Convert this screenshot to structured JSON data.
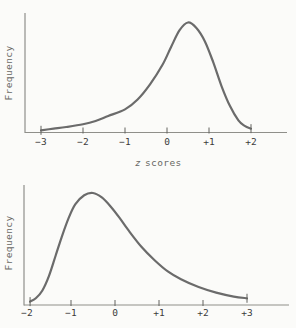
{
  "figure": {
    "background": "#fbfbf9",
    "colors": {
      "curve": "#6b6b6b",
      "axis": "#8f8f8a",
      "tick": "#62625e",
      "tick_label": "#3c3c3c",
      "axis_title": "#686864"
    }
  },
  "chart_data": [
    {
      "type": "line",
      "title": "",
      "description": "Negatively skewed frequency distribution curve of z scores; long tail to the left, peak near z = +0.5, curve ends at z = +2",
      "ylabel": "Frequency",
      "xlabel": "z scores",
      "xlabel_var": "z",
      "xlabel_rest": "scores",
      "x_tick_labels": [
        "−3",
        "−2",
        "−1",
        "0",
        "+1",
        "+2"
      ],
      "x_tick_values": [
        -3,
        -2,
        -1,
        0,
        1,
        2
      ],
      "x_range": [
        -3,
        2
      ],
      "y_range_relative": [
        0,
        1
      ],
      "peak": {
        "z": 0.5,
        "relative_frequency": 1.0
      },
      "skew": "negative",
      "grid": false,
      "legend": false,
      "curve_points": [
        [
          -3.0,
          0.02
        ],
        [
          -2.7,
          0.035
        ],
        [
          -2.4,
          0.05
        ],
        [
          -2.0,
          0.075
        ],
        [
          -1.7,
          0.105
        ],
        [
          -1.4,
          0.15
        ],
        [
          -1.0,
          0.21
        ],
        [
          -0.7,
          0.3
        ],
        [
          -0.4,
          0.44
        ],
        [
          -0.1,
          0.62
        ],
        [
          0.1,
          0.78
        ],
        [
          0.3,
          0.93
        ],
        [
          0.5,
          1.0
        ],
        [
          0.7,
          0.95
        ],
        [
          0.9,
          0.83
        ],
        [
          1.1,
          0.64
        ],
        [
          1.3,
          0.42
        ],
        [
          1.5,
          0.24
        ],
        [
          1.7,
          0.11
        ],
        [
          1.85,
          0.06
        ],
        [
          2.0,
          0.035
        ]
      ]
    },
    {
      "type": "line",
      "title": "",
      "description": "Positively skewed frequency distribution curve of z scores; steep rise on the left, peak near z = -0.5, long tail to the right ending at z = +3",
      "ylabel": "Frequency",
      "xlabel": "",
      "x_tick_labels": [
        "−2",
        "−1",
        "0",
        "+1",
        "+2",
        "+3"
      ],
      "x_tick_values": [
        -2,
        -1,
        0,
        1,
        2,
        3
      ],
      "x_range": [
        -2,
        3
      ],
      "y_range_relative": [
        0,
        1
      ],
      "peak": {
        "z": -0.5,
        "relative_frequency": 1.0
      },
      "skew": "positive",
      "grid": false,
      "legend": false,
      "curve_points": [
        [
          -1.93,
          0.03
        ],
        [
          -1.8,
          0.06
        ],
        [
          -1.65,
          0.13
        ],
        [
          -1.5,
          0.26
        ],
        [
          -1.35,
          0.44
        ],
        [
          -1.2,
          0.62
        ],
        [
          -1.05,
          0.78
        ],
        [
          -0.9,
          0.9
        ],
        [
          -0.7,
          0.98
        ],
        [
          -0.5,
          1.0
        ],
        [
          -0.3,
          0.96
        ],
        [
          -0.1,
          0.88
        ],
        [
          0.1,
          0.78
        ],
        [
          0.3,
          0.67
        ],
        [
          0.6,
          0.52
        ],
        [
          0.9,
          0.4
        ],
        [
          1.2,
          0.3
        ],
        [
          1.5,
          0.23
        ],
        [
          1.9,
          0.16
        ],
        [
          2.3,
          0.11
        ],
        [
          2.7,
          0.075
        ],
        [
          3.0,
          0.06
        ]
      ]
    }
  ]
}
